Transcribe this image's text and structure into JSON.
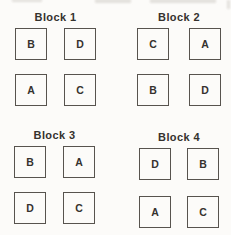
{
  "blocks": [
    {
      "title": "Block 1",
      "cells": [
        "B",
        "D",
        "A",
        "C"
      ]
    },
    {
      "title": "Block 2",
      "cells": [
        "C",
        "A",
        "B",
        "D"
      ]
    },
    {
      "title": "Block 3",
      "cells": [
        "B",
        "A",
        "D",
        "C"
      ]
    },
    {
      "title": "Block 4",
      "cells": [
        "D",
        "B",
        "A",
        "C"
      ]
    }
  ],
  "colors": {
    "background": "#fcfbf9",
    "line": "#57534e",
    "text": "#35322e"
  }
}
